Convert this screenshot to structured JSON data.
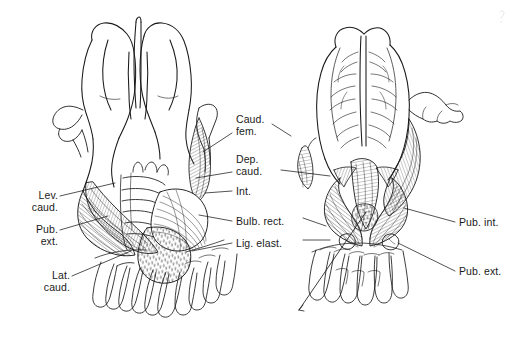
{
  "figure": {
    "background_color": "#ffffff",
    "ink_color": "#1a1a1a",
    "width": 522,
    "height": 345,
    "panels": [
      {
        "id": "left-panel",
        "name": "dorsal-view",
        "caption": ""
      },
      {
        "id": "right-panel",
        "name": "ventral-view",
        "caption": ""
      }
    ]
  },
  "labels": {
    "lev_caud": {
      "line1": "Lev.",
      "line2": "caud.",
      "full": "Lev. caud."
    },
    "pub_ext_l": {
      "line1": "Pub.",
      "line2": "ext.",
      "full": "Pub. ext."
    },
    "lat_caud": {
      "line1": "Lat.",
      "line2": "caud.",
      "full": "Lat. caud."
    },
    "caud_fem": {
      "line1": "Caud.",
      "line2": "fem.",
      "full": "Caud. fem."
    },
    "dep_caud": {
      "line1": "Dep.",
      "line2": "caud.",
      "full": "Dep. caud."
    },
    "int": {
      "line1": "Int.",
      "line2": "",
      "full": "Int."
    },
    "bulb_rect": {
      "line1": "Bulb. rect.",
      "line2": "",
      "full": "Bulb. rect."
    },
    "lig_elast": {
      "line1": "Lig. elast.",
      "line2": "",
      "full": "Lig. elast."
    },
    "pub_int_r": {
      "line1": "Pub. int.",
      "line2": "",
      "full": "Pub. int."
    },
    "pub_ext_r": {
      "line1": "Pub. ext.",
      "line2": "",
      "full": "Pub. ext."
    }
  }
}
